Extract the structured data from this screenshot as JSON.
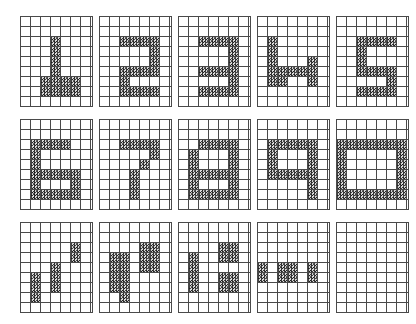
{
  "figure": {
    "background_color": "#ffffff",
    "grid_line_color": "#4a4a4a",
    "cell_fill_color": "#8d8d8d",
    "cell_fill_style": "dithered-noise",
    "layout": {
      "panel_rows": 3,
      "panel_columns": 5,
      "grid_columns": 7,
      "grid_rows": 9,
      "panel_width_px": 72,
      "panel_height_px": 90,
      "cell_width_px": 10,
      "cell_height_px": 10,
      "panel_gap_x_px": 7,
      "panel_gap_y_px": 13,
      "origin_x_px": 20,
      "origin_y_px": 16
    },
    "panels": [
      {
        "index": 0,
        "row": 0,
        "col": 0,
        "label": "1",
        "name": "panel-digit-1",
        "cells": [
          [
            3,
            2
          ],
          [
            3,
            3
          ],
          [
            3,
            4
          ],
          [
            3,
            5
          ],
          [
            3,
            6
          ],
          [
            3,
            7
          ],
          [
            2,
            6
          ],
          [
            2,
            7
          ],
          [
            4,
            6
          ],
          [
            4,
            7
          ],
          [
            5,
            6
          ],
          [
            5,
            7
          ]
        ]
      },
      {
        "index": 1,
        "row": 0,
        "col": 1,
        "label": "2",
        "name": "panel-digit-2",
        "cells": [
          [
            2,
            2
          ],
          [
            3,
            2
          ],
          [
            4,
            2
          ],
          [
            5,
            2
          ],
          [
            5,
            3
          ],
          [
            5,
            4
          ],
          [
            2,
            5
          ],
          [
            3,
            5
          ],
          [
            4,
            5
          ],
          [
            5,
            5
          ],
          [
            2,
            6
          ],
          [
            2,
            7
          ],
          [
            3,
            7
          ],
          [
            4,
            7
          ],
          [
            5,
            7
          ]
        ]
      },
      {
        "index": 2,
        "row": 0,
        "col": 2,
        "label": "3",
        "name": "panel-digit-3",
        "cells": [
          [
            2,
            2
          ],
          [
            3,
            2
          ],
          [
            4,
            2
          ],
          [
            5,
            2
          ],
          [
            5,
            3
          ],
          [
            5,
            4
          ],
          [
            2,
            5
          ],
          [
            3,
            5
          ],
          [
            4,
            5
          ],
          [
            5,
            5
          ],
          [
            5,
            6
          ],
          [
            2,
            7
          ],
          [
            3,
            7
          ],
          [
            4,
            7
          ],
          [
            5,
            7
          ]
        ]
      },
      {
        "index": 3,
        "row": 0,
        "col": 3,
        "label": "4",
        "name": "panel-digit-4",
        "cells": [
          [
            1,
            2
          ],
          [
            1,
            3
          ],
          [
            1,
            4
          ],
          [
            1,
            5
          ],
          [
            2,
            5
          ],
          [
            3,
            5
          ],
          [
            4,
            5
          ],
          [
            5,
            5
          ],
          [
            5,
            4
          ],
          [
            5,
            6
          ],
          [
            1,
            6
          ],
          [
            2,
            6
          ]
        ]
      },
      {
        "index": 4,
        "row": 0,
        "col": 4,
        "label": "5",
        "name": "panel-digit-5",
        "cells": [
          [
            2,
            2
          ],
          [
            3,
            2
          ],
          [
            4,
            2
          ],
          [
            5,
            2
          ],
          [
            2,
            3
          ],
          [
            2,
            4
          ],
          [
            2,
            5
          ],
          [
            3,
            5
          ],
          [
            4,
            5
          ],
          [
            5,
            5
          ],
          [
            5,
            6
          ],
          [
            2,
            7
          ],
          [
            3,
            7
          ],
          [
            4,
            7
          ],
          [
            5,
            7
          ]
        ]
      },
      {
        "index": 5,
        "row": 1,
        "col": 0,
        "label": "6",
        "name": "panel-digit-6",
        "cells": [
          [
            2,
            2
          ],
          [
            3,
            2
          ],
          [
            4,
            2
          ],
          [
            1,
            2
          ],
          [
            1,
            3
          ],
          [
            1,
            4
          ],
          [
            1,
            5
          ],
          [
            1,
            6
          ],
          [
            1,
            7
          ],
          [
            1,
            5
          ],
          [
            2,
            5
          ],
          [
            3,
            5
          ],
          [
            4,
            5
          ],
          [
            5,
            5
          ],
          [
            5,
            6
          ],
          [
            1,
            7
          ],
          [
            2,
            7
          ],
          [
            3,
            7
          ],
          [
            4,
            7
          ],
          [
            5,
            7
          ]
        ]
      },
      {
        "index": 6,
        "row": 1,
        "col": 1,
        "label": "7",
        "name": "panel-digit-7",
        "cells": [
          [
            2,
            2
          ],
          [
            3,
            2
          ],
          [
            4,
            2
          ],
          [
            5,
            2
          ],
          [
            5,
            3
          ],
          [
            4,
            4
          ],
          [
            3,
            5
          ],
          [
            3,
            6
          ],
          [
            3,
            7
          ]
        ]
      },
      {
        "index": 7,
        "row": 1,
        "col": 2,
        "label": "8",
        "name": "panel-digit-8",
        "cells": [
          [
            2,
            2
          ],
          [
            3,
            2
          ],
          [
            4,
            2
          ],
          [
            5,
            2
          ],
          [
            1,
            3
          ],
          [
            5,
            3
          ],
          [
            1,
            4
          ],
          [
            5,
            4
          ],
          [
            1,
            5
          ],
          [
            2,
            5
          ],
          [
            3,
            5
          ],
          [
            4,
            5
          ],
          [
            5,
            5
          ],
          [
            1,
            6
          ],
          [
            5,
            6
          ],
          [
            1,
            7
          ],
          [
            2,
            7
          ],
          [
            3,
            7
          ],
          [
            4,
            7
          ],
          [
            5,
            7
          ]
        ]
      },
      {
        "index": 8,
        "row": 1,
        "col": 3,
        "label": "9",
        "name": "panel-digit-9",
        "cells": [
          [
            1,
            2
          ],
          [
            2,
            2
          ],
          [
            3,
            2
          ],
          [
            4,
            2
          ],
          [
            5,
            2
          ],
          [
            1,
            3
          ],
          [
            5,
            3
          ],
          [
            1,
            4
          ],
          [
            5,
            4
          ],
          [
            1,
            5
          ],
          [
            2,
            5
          ],
          [
            3,
            5
          ],
          [
            4,
            5
          ],
          [
            5,
            5
          ],
          [
            5,
            6
          ],
          [
            5,
            7
          ]
        ]
      },
      {
        "index": 9,
        "row": 1,
        "col": 4,
        "label": "0",
        "name": "panel-digit-0",
        "cells": [
          [
            0,
            2
          ],
          [
            1,
            2
          ],
          [
            2,
            2
          ],
          [
            3,
            2
          ],
          [
            4,
            2
          ],
          [
            5,
            2
          ],
          [
            6,
            2
          ],
          [
            0,
            3
          ],
          [
            6,
            3
          ],
          [
            0,
            4
          ],
          [
            6,
            4
          ],
          [
            0,
            5
          ],
          [
            6,
            5
          ],
          [
            0,
            6
          ],
          [
            6,
            6
          ],
          [
            0,
            7
          ],
          [
            1,
            7
          ],
          [
            2,
            7
          ],
          [
            3,
            7
          ],
          [
            4,
            7
          ],
          [
            5,
            7
          ],
          [
            6,
            7
          ]
        ]
      },
      {
        "index": 10,
        "row": 2,
        "col": 0,
        "label": "fragment-a",
        "name": "panel-fragment-a",
        "cells": [
          [
            5,
            2
          ],
          [
            5,
            3
          ],
          [
            3,
            4
          ],
          [
            3,
            5
          ],
          [
            3,
            6
          ],
          [
            1,
            5
          ],
          [
            1,
            6
          ],
          [
            1,
            7
          ]
        ]
      },
      {
        "index": 11,
        "row": 2,
        "col": 1,
        "label": "fragment-b",
        "name": "panel-fragment-b",
        "cells": [
          [
            4,
            2
          ],
          [
            5,
            2
          ],
          [
            4,
            3
          ],
          [
            5,
            3
          ],
          [
            4,
            4
          ],
          [
            5,
            4
          ],
          [
            1,
            3
          ],
          [
            1,
            4
          ],
          [
            1,
            5
          ],
          [
            1,
            6
          ],
          [
            2,
            3
          ],
          [
            2,
            4
          ],
          [
            2,
            5
          ],
          [
            2,
            6
          ],
          [
            2,
            7
          ]
        ]
      },
      {
        "index": 12,
        "row": 2,
        "col": 2,
        "label": "fragment-c",
        "name": "panel-fragment-c",
        "cells": [
          [
            1,
            3
          ],
          [
            1,
            4
          ],
          [
            1,
            5
          ],
          [
            1,
            6
          ],
          [
            4,
            2
          ],
          [
            5,
            2
          ],
          [
            4,
            3
          ],
          [
            5,
            3
          ],
          [
            4,
            5
          ],
          [
            5,
            5
          ],
          [
            4,
            6
          ],
          [
            5,
            6
          ]
        ]
      },
      {
        "index": 13,
        "row": 2,
        "col": 3,
        "label": "fragment-d",
        "name": "panel-fragment-d",
        "cells": [
          [
            0,
            4
          ],
          [
            0,
            5
          ],
          [
            2,
            4
          ],
          [
            2,
            5
          ],
          [
            3,
            4
          ],
          [
            3,
            5
          ],
          [
            5,
            4
          ],
          [
            5,
            5
          ]
        ]
      },
      {
        "index": 14,
        "row": 2,
        "col": 4,
        "label": "empty",
        "name": "panel-empty",
        "cells": []
      }
    ]
  }
}
